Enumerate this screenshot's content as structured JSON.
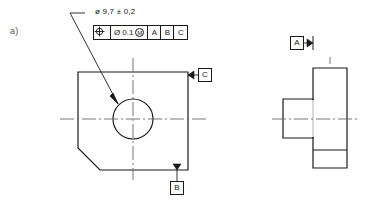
{
  "figure": {
    "label": "a)"
  },
  "dimension": {
    "diameter_symbol": "ø",
    "value": "9,7",
    "tolerance": "± 0,2",
    "full_text": "ø 9,7 ± 0,2"
  },
  "feature_control_frame": {
    "characteristic_symbol": "position",
    "tolerance_diameter_symbol": "Ø",
    "tolerance_value": "0.1",
    "material_condition_modifier": "M",
    "datum_primary": "A",
    "datum_secondary": "B",
    "datum_tertiary": "C"
  },
  "datums": {
    "a": "A",
    "b": "B",
    "c": "C"
  },
  "views": {
    "front": {
      "name": "front-view",
      "shape": "square-plate-chamfered-corner",
      "hole": "center-through-hole"
    },
    "side": {
      "name": "side-view",
      "shape": "stepped-boss-profile"
    }
  },
  "colors": {
    "line": "#1a1a1a",
    "centerline": "#666666",
    "label": "#555555",
    "background": "#ffffff"
  }
}
